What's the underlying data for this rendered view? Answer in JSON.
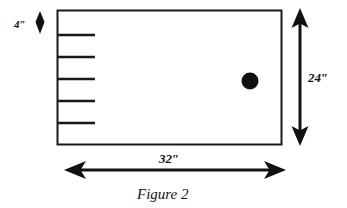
{
  "figure": {
    "caption": "Figure 2",
    "shape": "rectangle",
    "colors": {
      "stroke": "#1a1a1a",
      "fill": "#ffffff",
      "hole_fill": "#111111",
      "background": "#ffffff"
    },
    "dimensions": {
      "width_label": "32″",
      "height_label": "24″",
      "tick_spacing_label": "4″"
    },
    "tick_marks": {
      "count": 5,
      "edge": "left",
      "spacing_label": "4″"
    },
    "hole": {
      "name": "hole",
      "shape": "circle"
    }
  }
}
